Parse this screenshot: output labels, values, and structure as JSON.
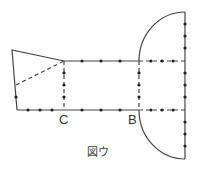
{
  "figure": {
    "caption": "図ウ",
    "labels": {
      "C": "C",
      "B": "B"
    },
    "colors": {
      "line": "#444444",
      "dot": "#222222",
      "background": "#ffffff"
    }
  }
}
